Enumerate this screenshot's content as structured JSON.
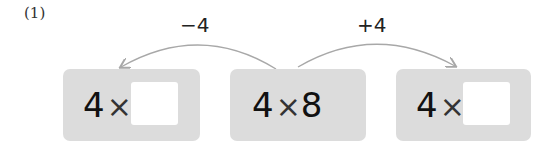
{
  "problem": {
    "label": "(1)"
  },
  "operations": {
    "left": "−4",
    "right": "+4"
  },
  "boxes": {
    "left": {
      "multiplicand": "4",
      "operator": "×",
      "answer": ""
    },
    "middle": {
      "multiplicand": "4",
      "operator": "×",
      "multiplier": "8"
    },
    "right": {
      "multiplicand": "4",
      "operator": "×",
      "answer": ""
    }
  },
  "colors": {
    "box": "#dcdcdc",
    "arrow": "#a8a8a8",
    "blank": "#ffffff"
  }
}
